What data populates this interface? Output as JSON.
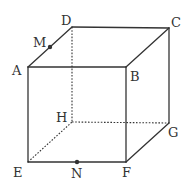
{
  "diagram": {
    "type": "cube",
    "colors": {
      "edge": "#333333",
      "background": "#ffffff"
    },
    "vertices": {
      "A": {
        "label": "A",
        "x": 28,
        "y": 67,
        "lx": 12,
        "ly": 75
      },
      "B": {
        "label": "B",
        "x": 126,
        "y": 67,
        "lx": 130,
        "ly": 81
      },
      "C": {
        "label": "C",
        "x": 169,
        "y": 28,
        "lx": 171,
        "ly": 27
      },
      "D": {
        "label": "D",
        "x": 72,
        "y": 27,
        "lx": 61,
        "ly": 25
      },
      "E": {
        "label": "E",
        "x": 28,
        "y": 162,
        "lx": 13,
        "ly": 177
      },
      "F": {
        "label": "F",
        "x": 126,
        "y": 162,
        "lx": 122,
        "ly": 177
      },
      "G": {
        "label": "G",
        "x": 169,
        "y": 123,
        "lx": 168,
        "ly": 137
      },
      "H": {
        "label": "H",
        "x": 72,
        "y": 122,
        "lx": 56,
        "ly": 122
      }
    },
    "points": {
      "M": {
        "label": "M",
        "x": 50,
        "y": 47,
        "lx": 33,
        "ly": 47,
        "on_edge": "AD"
      },
      "N": {
        "label": "N",
        "x": 77,
        "y": 162,
        "lx": 71,
        "ly": 178,
        "on_edge": "EF"
      }
    },
    "solid_edges": [
      "AB",
      "BC",
      "CD",
      "DA",
      "AE",
      "BF",
      "CG",
      "EF",
      "FG"
    ],
    "hidden_edges": [
      "DH",
      "EH",
      "HG"
    ]
  }
}
